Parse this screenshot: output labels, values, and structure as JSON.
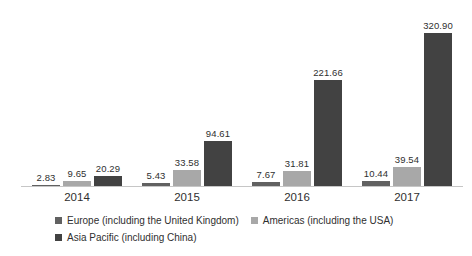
{
  "chart_data": {
    "type": "bar",
    "title": "",
    "xlabel": "",
    "ylabel": "",
    "categories": [
      "2014",
      "2015",
      "2016",
      "2017"
    ],
    "series": [
      {
        "name": "Europe (including the United Kingdom)",
        "color": "#616161",
        "values": [
          2.83,
          5.43,
          7.67,
          10.44
        ]
      },
      {
        "name": "Americas (including the USA)",
        "color": "#a8a8a8",
        "values": [
          9.65,
          33.58,
          31.81,
          39.54
        ]
      },
      {
        "name": "Asia Pacific (including China)",
        "color": "#424242",
        "values": [
          20.29,
          94.61,
          221.66,
          320.9
        ]
      }
    ],
    "data_labels": {
      "visible": true,
      "labels": [
        [
          "2.83",
          "5.43",
          "7.67",
          "10.44"
        ],
        [
          "9.65",
          "33.58",
          "31.81",
          "39.54"
        ],
        [
          "20.29",
          "94.61",
          "221.66",
          "320.90"
        ]
      ]
    },
    "ylim": [
      0,
      337
    ],
    "grid": false,
    "y_axis_visible": false,
    "legend_position": "bottom",
    "axis_color": "#c6c6c6",
    "text_color": "#2f2f2f",
    "background_color": "#ffffff"
  }
}
